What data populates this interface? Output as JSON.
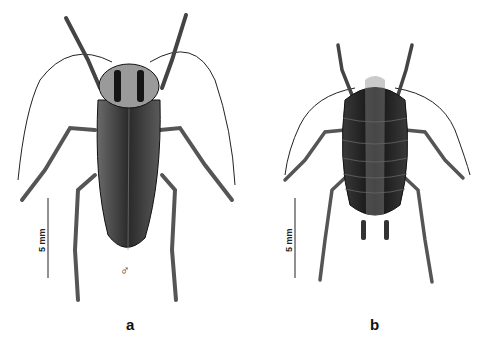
{
  "figure": {
    "panels": [
      {
        "id": "a",
        "label": "a",
        "subject": "adult cockroach (winged)",
        "sex_symbol": "♂",
        "scale_bar": "5 mm"
      },
      {
        "id": "b",
        "label": "b",
        "subject": "cockroach nymph",
        "scale_bar": "5 mm"
      }
    ],
    "colors": {
      "background": "#ffffff",
      "ink": "#1a1a1a",
      "wing": "#3a3a3a",
      "body": "#222222"
    }
  }
}
